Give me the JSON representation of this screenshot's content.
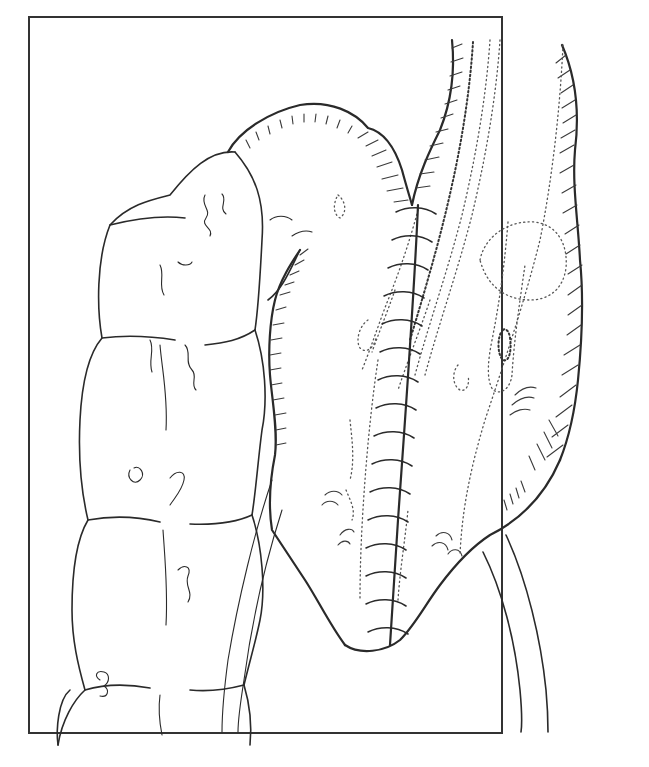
{
  "figure": {
    "kind": "surgical line-art illustration",
    "background": "#ffffff",
    "ink_color": "#2a2a2a",
    "frame": {
      "x": 29,
      "y": 17,
      "width": 473,
      "height": 716,
      "stroke": "#333333",
      "stroke_width": 2
    },
    "suture_line": {
      "x_top": 418,
      "y_top": 205,
      "x_bottom": 390,
      "y_bottom": 640,
      "stitch_count": 16
    },
    "text_labels": []
  }
}
